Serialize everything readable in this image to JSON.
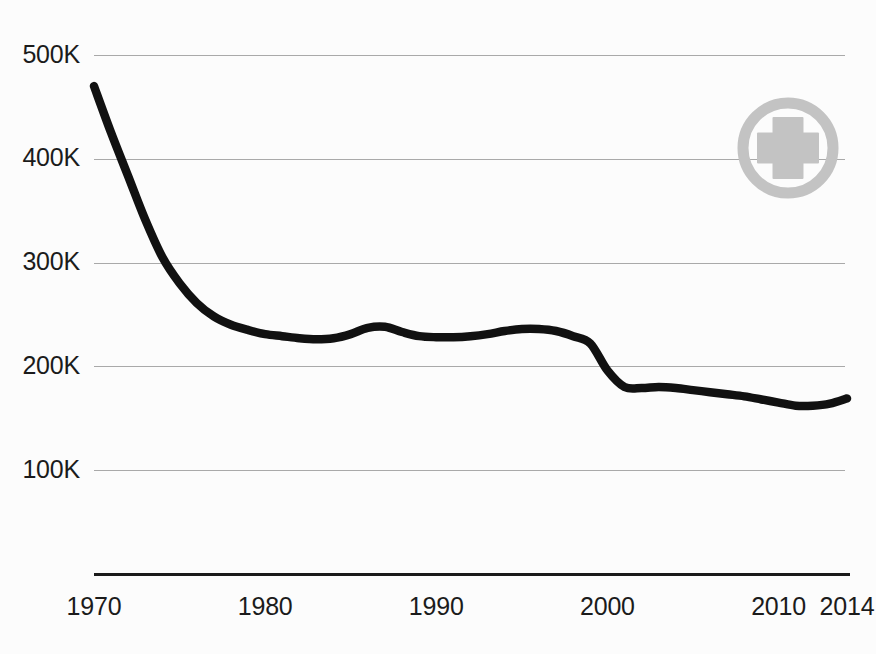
{
  "chart_data": {
    "type": "line",
    "title": "",
    "subtitle": "",
    "xlabel": "",
    "ylabel": "",
    "xlim": [
      1970,
      2014
    ],
    "ylim": [
      0,
      500000
    ],
    "grid": true,
    "gridlines_y": [
      100000,
      200000,
      300000,
      400000,
      500000
    ],
    "legend": "none",
    "y_tick_labels": [
      "500K",
      "400K",
      "300K",
      "200K",
      "100K"
    ],
    "y_tick_values": [
      500000,
      400000,
      300000,
      200000,
      100000
    ],
    "x_tick_labels": [
      "1970",
      "1980",
      "1990",
      "2000",
      "2010",
      "2014"
    ],
    "x_tick_values": [
      1970,
      1980,
      1990,
      2000,
      2010,
      2014
    ],
    "series": [
      {
        "name": "value",
        "color": "#111111",
        "x": [
          1970,
          1971,
          1972,
          1973,
          1974,
          1975,
          1976,
          1977,
          1978,
          1979,
          1980,
          1981,
          1982,
          1983,
          1984,
          1985,
          1986,
          1987,
          1988,
          1989,
          1990,
          1991,
          1992,
          1993,
          1994,
          1995,
          1996,
          1997,
          1998,
          1999,
          2000,
          2001,
          2002,
          2003,
          2004,
          2005,
          2006,
          2007,
          2008,
          2009,
          2010,
          2011,
          2012,
          2013,
          2014
        ],
        "values": [
          470000,
          425000,
          383000,
          341000,
          305000,
          280000,
          261000,
          248000,
          240000,
          235000,
          231000,
          229000,
          227000,
          226000,
          227000,
          231000,
          237000,
          238000,
          233000,
          229000,
          228000,
          228000,
          229000,
          231000,
          234000,
          236000,
          236000,
          234000,
          229000,
          222000,
          196000,
          180000,
          179000,
          180000,
          179000,
          177000,
          175000,
          173000,
          171000,
          168000,
          165000,
          162000,
          162000,
          164000,
          169000
        ]
      }
    ],
    "annotations": [
      {
        "name": "medical-cross-badge",
        "icon": "medical-cross-circle-icon",
        "color": "#c3c3c3",
        "position": "top-right"
      }
    ]
  },
  "axis_colors": {
    "grid": "#a9a9a9",
    "axis": "#1a1a1a",
    "line": "#111111",
    "badge": "#c3c3c3",
    "background": "#fcfcfc"
  }
}
